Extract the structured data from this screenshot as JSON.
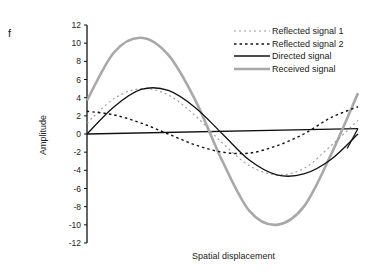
{
  "panel_label": "f",
  "chart_data": {
    "type": "line",
    "title": "",
    "xlabel": "Spatial displacement",
    "ylabel": "Amplitude",
    "ylim": [
      -12,
      12
    ],
    "yticks": [
      12,
      10,
      8,
      6,
      4,
      2,
      0,
      -2,
      -4,
      -6,
      -8,
      -10,
      -12
    ],
    "grid": false,
    "legend_position": "upper right",
    "x": [
      0,
      0.1,
      0.2,
      0.3,
      0.4,
      0.5,
      0.6,
      0.7,
      0.8,
      0.9,
      1.0
    ],
    "series": [
      {
        "name": "Reflected signal 1",
        "style": "dotted-gray",
        "values": [
          1.2,
          3.9,
          5.0,
          4.3,
          2.0,
          -1.0,
          -3.5,
          -4.5,
          -3.8,
          -1.3,
          1.5
        ]
      },
      {
        "name": "Reflected signal 2",
        "style": "dashed-black",
        "values": [
          2.5,
          2.1,
          1.2,
          0.0,
          -1.2,
          -2.0,
          -2.1,
          -1.3,
          0.0,
          1.8,
          3.0
        ]
      },
      {
        "name": "Directed signal",
        "style": "solid-black",
        "values": [
          0.0,
          3.0,
          4.9,
          4.8,
          2.9,
          0.0,
          -2.9,
          -4.5,
          -4.4,
          -2.8,
          0.0
        ]
      },
      {
        "name": "Received signal",
        "style": "thick-gray",
        "values": [
          3.7,
          9.0,
          10.6,
          8.7,
          3.7,
          -3.0,
          -8.5,
          -10.0,
          -8.0,
          -2.3,
          4.5
        ]
      }
    ],
    "reference_line": {
      "name": "baseline",
      "from": [
        0,
        0
      ],
      "to": [
        1.0,
        0.6
      ]
    }
  },
  "legend": [
    {
      "label": "Reflected signal 1"
    },
    {
      "label": "Reflected signal 2"
    },
    {
      "label": "Directed signal"
    },
    {
      "label": "Received signal"
    }
  ],
  "axis": {
    "ylabel": "Amplitude",
    "xlabel": "Spatial displacement"
  },
  "colors": {
    "gray": "#a8a8a8",
    "black": "#111111"
  }
}
